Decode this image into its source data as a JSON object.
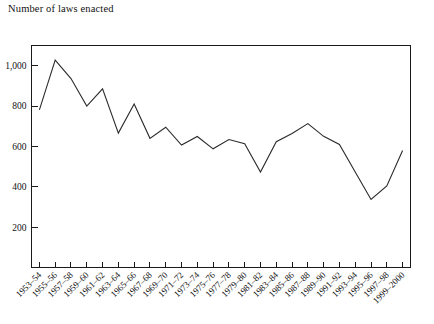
{
  "figure": {
    "title": "Number of laws enacted",
    "background_color": "#ffffff",
    "line_color": "#2b2b2b",
    "axis_color": "#1a1a1a"
  },
  "chart_data": {
    "type": "line",
    "title": "Number of laws enacted",
    "xlabel": "",
    "ylabel": "Number of laws enacted",
    "ylim": [
      0,
      1100
    ],
    "yticks": [
      200,
      400,
      600,
      800,
      1000
    ],
    "ytick_labels": [
      "200",
      "400",
      "600",
      "800",
      "1,000"
    ],
    "grid": false,
    "legend": "none",
    "categories": [
      "1953–54",
      "1955–56",
      "1957–58",
      "1959–60",
      "1961–62",
      "1963–64",
      "1965–66",
      "1967–68",
      "1969–70",
      "1971–72",
      "1973–74",
      "1975–76",
      "1977–78",
      "1979–80",
      "1981–82",
      "1983–84",
      "1985–86",
      "1987–88",
      "1989–90",
      "1991–92",
      "1993–94",
      "1995–96",
      "1997–98",
      "1999–2000"
    ],
    "values": [
      781,
      1028,
      936,
      800,
      885,
      666,
      810,
      640,
      695,
      607,
      649,
      588,
      634,
      613,
      473,
      623,
      664,
      713,
      650,
      610,
      473,
      337,
      404,
      580
    ]
  }
}
